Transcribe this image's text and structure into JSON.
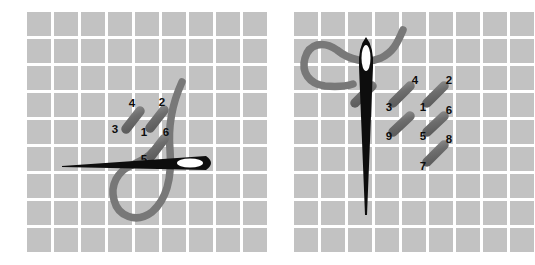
{
  "document": {
    "title": "Embroidery stitch diagram",
    "description": "Two-panel needlework instruction diagram on gridded fabric",
    "background_color": "#ffffff"
  },
  "colors": {
    "fabric_square": "#c2c2c2",
    "fabric_gap": "#ffffff",
    "needle": "#0d0d0d",
    "needle_eye": "#ffffff",
    "thread": "#787878",
    "stitch_mark": "#6e6e6e",
    "stitch_mark_highlight": "#8a8a8a",
    "number_text": "#0d0d0d"
  },
  "grid": {
    "columns": 9,
    "rows": 9,
    "cell_size": 24,
    "gap": 3,
    "pitch": 27
  },
  "panels": [
    {
      "id": "panel-left",
      "name": "step-one-panel",
      "origin": {
        "x": 27,
        "y": 12
      },
      "needle": {
        "name": "needle-horizontal",
        "orientation": "horizontal",
        "tip": {
          "x": 62,
          "y": 165
        },
        "eye_end": {
          "x": 216,
          "y": 163
        },
        "eye": {
          "cx": 190,
          "cy": 163,
          "rx": 13,
          "ry": 4.5
        }
      },
      "thread": {
        "name": "thread-loop",
        "path": "M 182,82 C 172,104 168,128 170,150 C 172,176 168,198 152,212 C 136,224 118,216 114,200 C 110,184 118,172 130,166 C 140,161 148,158 152,152"
      },
      "stitches": [
        {
          "label": "4",
          "name": "stitch-mark-4",
          "x1": 126,
          "y1": 129,
          "x2": 140,
          "y2": 111,
          "label_x": 132,
          "label_y": 104
        },
        {
          "label": "3",
          "name": "stitch-label-3",
          "label_only": true,
          "label_x": 115,
          "label_y": 130
        },
        {
          "label": "2",
          "name": "stitch-mark-2",
          "x1": 150,
          "y1": 128,
          "x2": 164,
          "y2": 110,
          "label_x": 162,
          "label_y": 103
        },
        {
          "label": "1",
          "name": "stitch-label-1",
          "label_only": true,
          "label_x": 144,
          "label_y": 133
        },
        {
          "label": "6",
          "name": "stitch-mark-6",
          "x1": 151,
          "y1": 156,
          "x2": 164,
          "y2": 139,
          "label_x": 166,
          "label_y": 133
        },
        {
          "label": "5",
          "name": "stitch-label-5",
          "label_only": true,
          "label_x": 144,
          "label_y": 160
        }
      ]
    },
    {
      "id": "panel-right",
      "name": "step-two-panel",
      "origin": {
        "x": 27,
        "y": 12
      },
      "needle": {
        "name": "needle-vertical",
        "orientation": "vertical",
        "head": {
          "x": 99,
          "y": 37
        },
        "tip": {
          "x": 99,
          "y": 215
        },
        "eye": {
          "cx": 99,
          "cy": 58,
          "rx": 4.5,
          "ry": 13
        }
      },
      "thread": {
        "name": "thread-loop",
        "path": "M 136,30 C 130,44 126,52 114,58 C 100,64 82,60 70,50 C 56,40 42,44 38,58 C 34,72 42,84 58,86 C 70,87 80,86 86,84"
      },
      "stitches": [
        {
          "label": "4",
          "name": "stitch-mark-4",
          "x1": 126,
          "y1": 103,
          "x2": 143,
          "y2": 86,
          "label_x": 148,
          "label_y": 81
        },
        {
          "label": "3",
          "name": "stitch-label-3",
          "label_only": true,
          "label_x": 122,
          "label_y": 108
        },
        {
          "label": "2",
          "name": "stitch-mark-2",
          "x1": 160,
          "y1": 103,
          "x2": 177,
          "y2": 86,
          "label_x": 182,
          "label_y": 81
        },
        {
          "label": "1",
          "name": "stitch-label-1",
          "label_only": true,
          "label_x": 156,
          "label_y": 108
        },
        {
          "label": "6",
          "name": "stitch-mark-6",
          "x1": 160,
          "y1": 132,
          "x2": 177,
          "y2": 116,
          "label_x": 182,
          "label_y": 111
        },
        {
          "label": "5",
          "name": "stitch-label-5",
          "label_only": true,
          "label_x": 156,
          "label_y": 137
        },
        {
          "label": "9",
          "name": "stitch-mark-9",
          "x1": 126,
          "y1": 132,
          "x2": 143,
          "y2": 116,
          "label_x": 122,
          "label_y": 137
        },
        {
          "label": "8",
          "name": "stitch-mark-8",
          "x1": 160,
          "y1": 162,
          "x2": 177,
          "y2": 145,
          "label_x": 182,
          "label_y": 140
        },
        {
          "label": "7",
          "name": "stitch-label-7",
          "label_only": true,
          "label_x": 156,
          "label_y": 167
        },
        {
          "label": "",
          "name": "stitch-mark-left-extra",
          "x1": 88,
          "y1": 103,
          "x2": 105,
          "y2": 86,
          "label_only": false,
          "no_label": true
        }
      ]
    }
  ]
}
